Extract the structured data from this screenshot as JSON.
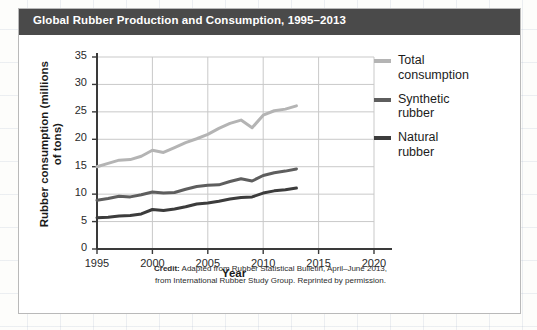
{
  "card": {
    "title": "Global Rubber Production and Consumption, 1995–2013"
  },
  "credit": {
    "label": "Credit:",
    "line1": " Adapted from Rubber Statistical Bulletin, April–June 2013,",
    "line2": "from International Rubber Study Group. Reprinted by permission."
  },
  "legend": {
    "items": [
      {
        "label": "Total\nconsumption",
        "color": "#b4b4b4"
      },
      {
        "label": "Synthetic\nrubber",
        "color": "#5e5e5e"
      },
      {
        "label": "Natural\nrubber",
        "color": "#3c3c3c"
      }
    ]
  },
  "chart_data": {
    "type": "line",
    "title": "Global Rubber Production and Consumption, 1995–2013",
    "xlabel": "Year",
    "ylabel": "Rubber consumption (millions of tons)",
    "xlim": [
      1995,
      2020
    ],
    "ylim": [
      0,
      35
    ],
    "xticks": [
      1995,
      2000,
      2005,
      2010,
      2015,
      2020
    ],
    "yticks": [
      0,
      5,
      10,
      15,
      20,
      25,
      30,
      35
    ],
    "grid": true,
    "legend_position": "right",
    "x": [
      1995,
      1996,
      1997,
      1998,
      1999,
      2000,
      2001,
      2002,
      2003,
      2004,
      2005,
      2006,
      2007,
      2008,
      2009,
      2010,
      2011,
      2012,
      2013
    ],
    "series": [
      {
        "name": "Total consumption",
        "color": "#b4b4b4",
        "values": [
          15.0,
          15.6,
          16.2,
          16.3,
          16.9,
          18.0,
          17.6,
          18.5,
          19.4,
          20.1,
          20.9,
          22.0,
          22.9,
          23.5,
          22.1,
          24.4,
          25.2,
          25.5,
          26.1
        ]
      },
      {
        "name": "Synthetic rubber",
        "color": "#5e5e5e",
        "values": [
          8.9,
          9.2,
          9.6,
          9.5,
          9.9,
          10.4,
          10.2,
          10.3,
          10.9,
          11.4,
          11.6,
          11.7,
          12.3,
          12.8,
          12.4,
          13.4,
          13.9,
          14.2,
          14.6
        ]
      },
      {
        "name": "Natural rubber",
        "color": "#3c3c3c",
        "values": [
          5.7,
          5.8,
          6.0,
          6.1,
          6.4,
          7.2,
          7.0,
          7.3,
          7.7,
          8.2,
          8.4,
          8.7,
          9.1,
          9.4,
          9.5,
          10.2,
          10.6,
          10.8,
          11.1
        ]
      }
    ]
  }
}
